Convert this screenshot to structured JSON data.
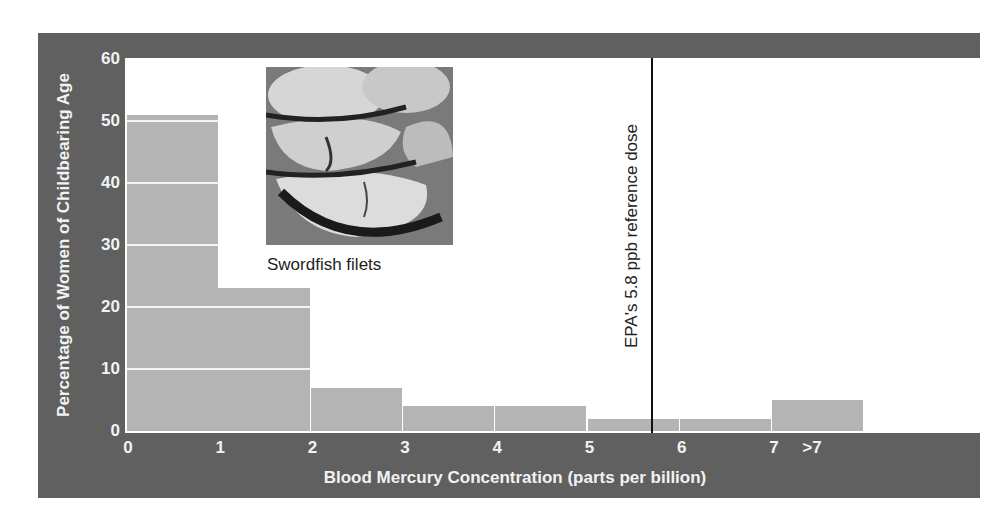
{
  "chart_data": {
    "type": "bar",
    "title": "",
    "xlabel": "Blood Mercury Concentration (parts per billion)",
    "ylabel": "Percentage of Women of Childbearing Age",
    "x_tick_labels": [
      "0",
      "1",
      "2",
      "3",
      "4",
      "5",
      "6",
      "7",
      ">7"
    ],
    "y_tick_labels": [
      "0",
      "10",
      "20",
      "30",
      "40",
      "50",
      "60"
    ],
    "ylim": [
      0,
      60
    ],
    "grid": "white horizontal lines inside bars at every 10",
    "categories": [
      "0-1",
      "1-2",
      "2-3",
      "3-4",
      "4-5",
      "5-6",
      "6-7",
      ">7"
    ],
    "values": [
      51,
      23,
      7,
      4,
      4,
      2,
      2,
      5
    ],
    "annotations": [
      {
        "type": "vertical-line",
        "x": 5.8,
        "label": "EPA's 5.8 ppb reference dose"
      },
      {
        "type": "image",
        "label": "Swordfish filets"
      }
    ],
    "colors": {
      "frame": "#606060",
      "bars": "#b4b4b4",
      "reference_line": "#111111"
    }
  },
  "photo": {
    "caption": "Swordfish filets"
  },
  "reference": {
    "label": "EPA's 5.8 ppb reference dose"
  }
}
